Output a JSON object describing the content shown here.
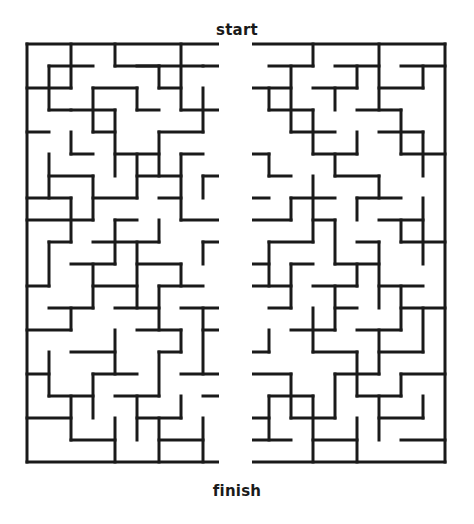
{
  "page": {
    "background_color": "#ffffff",
    "width": 474,
    "height": 524
  },
  "maze": {
    "start_label": "start",
    "finish_label": "finish",
    "wall_color": "#1a1a1a",
    "wall_thickness": 3,
    "cell_size": 22,
    "origin_x": 27,
    "origin_y": 44,
    "cols": 19,
    "rows": 19,
    "start_opening": {
      "col": 9,
      "side": "top"
    },
    "finish_opening": {
      "col": 9,
      "side": "bottom"
    },
    "spine_gap": {
      "x": 219,
      "width": 33
    },
    "h_walls": [
      [
        0,
        0,
        9
      ],
      [
        0,
        10,
        19
      ],
      [
        1,
        1,
        3
      ],
      [
        1,
        4,
        6
      ],
      [
        1,
        5,
        8
      ],
      [
        1,
        8,
        10
      ],
      [
        1,
        11,
        13
      ],
      [
        1,
        14,
        16
      ],
      [
        1,
        17,
        19
      ],
      [
        2,
        0,
        2
      ],
      [
        2,
        3,
        5
      ],
      [
        2,
        6,
        7
      ],
      [
        2,
        10,
        12
      ],
      [
        2,
        13,
        15
      ],
      [
        2,
        16,
        18
      ],
      [
        3,
        1,
        2
      ],
      [
        3,
        2,
        4
      ],
      [
        3,
        5,
        6
      ],
      [
        3,
        7,
        9
      ],
      [
        3,
        11,
        13
      ],
      [
        3,
        15,
        17
      ],
      [
        4,
        0,
        1
      ],
      [
        4,
        3,
        4
      ],
      [
        4,
        6,
        8
      ],
      [
        4,
        9,
        10
      ],
      [
        4,
        12,
        14
      ],
      [
        4,
        16,
        18
      ],
      [
        5,
        2,
        3
      ],
      [
        5,
        4,
        6
      ],
      [
        5,
        7,
        8
      ],
      [
        5,
        10,
        11
      ],
      [
        5,
        13,
        15
      ],
      [
        5,
        17,
        19
      ],
      [
        6,
        1,
        3
      ],
      [
        6,
        5,
        7
      ],
      [
        6,
        8,
        9
      ],
      [
        6,
        11,
        12
      ],
      [
        6,
        14,
        16
      ],
      [
        7,
        0,
        2
      ],
      [
        7,
        3,
        5
      ],
      [
        7,
        6,
        7
      ],
      [
        7,
        9,
        11
      ],
      [
        7,
        12,
        14
      ],
      [
        7,
        15,
        17
      ],
      [
        8,
        0,
        3
      ],
      [
        8,
        4,
        5
      ],
      [
        8,
        7,
        9
      ],
      [
        8,
        10,
        12
      ],
      [
        8,
        13,
        14
      ],
      [
        8,
        16,
        18
      ],
      [
        9,
        1,
        2
      ],
      [
        9,
        3,
        6
      ],
      [
        9,
        8,
        10
      ],
      [
        9,
        11,
        13
      ],
      [
        9,
        15,
        16
      ],
      [
        9,
        17,
        19
      ],
      [
        10,
        2,
        4
      ],
      [
        10,
        5,
        7
      ],
      [
        10,
        9,
        11
      ],
      [
        10,
        12,
        13
      ],
      [
        10,
        14,
        16
      ],
      [
        11,
        0,
        1
      ],
      [
        11,
        3,
        5
      ],
      [
        11,
        6,
        8
      ],
      [
        11,
        10,
        12
      ],
      [
        11,
        13,
        15
      ],
      [
        11,
        16,
        18
      ],
      [
        12,
        1,
        3
      ],
      [
        12,
        4,
        6
      ],
      [
        12,
        7,
        9
      ],
      [
        12,
        11,
        12
      ],
      [
        12,
        14,
        15
      ],
      [
        12,
        17,
        19
      ],
      [
        13,
        0,
        2
      ],
      [
        13,
        5,
        7
      ],
      [
        13,
        8,
        10
      ],
      [
        13,
        12,
        14
      ],
      [
        13,
        15,
        17
      ],
      [
        14,
        2,
        4
      ],
      [
        14,
        6,
        7
      ],
      [
        14,
        9,
        11
      ],
      [
        14,
        13,
        15
      ],
      [
        14,
        16,
        18
      ],
      [
        15,
        0,
        1
      ],
      [
        15,
        3,
        5
      ],
      [
        15,
        7,
        9
      ],
      [
        15,
        10,
        12
      ],
      [
        15,
        14,
        16
      ],
      [
        15,
        17,
        19
      ],
      [
        16,
        1,
        3
      ],
      [
        16,
        4,
        6
      ],
      [
        16,
        8,
        10
      ],
      [
        16,
        11,
        13
      ],
      [
        16,
        15,
        17
      ],
      [
        17,
        0,
        2
      ],
      [
        17,
        5,
        7
      ],
      [
        17,
        9,
        11
      ],
      [
        17,
        12,
        14
      ],
      [
        17,
        16,
        18
      ],
      [
        18,
        2,
        4
      ],
      [
        18,
        6,
        8
      ],
      [
        18,
        10,
        12
      ],
      [
        18,
        13,
        15
      ],
      [
        18,
        17,
        19
      ],
      [
        19,
        0,
        9
      ],
      [
        19,
        10,
        19
      ]
    ],
    "v_walls": [
      [
        0,
        0,
        19
      ],
      [
        1,
        1,
        3
      ],
      [
        1,
        5,
        7
      ],
      [
        1,
        9,
        11
      ],
      [
        1,
        14,
        16
      ],
      [
        2,
        0,
        2
      ],
      [
        2,
        4,
        5
      ],
      [
        2,
        7,
        9
      ],
      [
        2,
        12,
        13
      ],
      [
        2,
        16,
        18
      ],
      [
        3,
        2,
        4
      ],
      [
        3,
        6,
        8
      ],
      [
        3,
        10,
        12
      ],
      [
        3,
        15,
        17
      ],
      [
        4,
        0,
        1
      ],
      [
        4,
        3,
        6
      ],
      [
        4,
        8,
        10
      ],
      [
        4,
        13,
        15
      ],
      [
        4,
        17,
        19
      ],
      [
        5,
        2,
        3
      ],
      [
        5,
        5,
        7
      ],
      [
        5,
        9,
        12
      ],
      [
        5,
        16,
        18
      ],
      [
        6,
        1,
        2
      ],
      [
        6,
        4,
        6
      ],
      [
        6,
        8,
        9
      ],
      [
        6,
        11,
        13
      ],
      [
        6,
        14,
        16
      ],
      [
        6,
        17,
        19
      ],
      [
        7,
        0,
        3
      ],
      [
        7,
        5,
        8
      ],
      [
        7,
        10,
        11
      ],
      [
        7,
        13,
        14
      ],
      [
        7,
        16,
        17
      ],
      [
        8,
        2,
        4
      ],
      [
        8,
        6,
        7
      ],
      [
        8,
        9,
        10
      ],
      [
        8,
        12,
        15
      ],
      [
        8,
        17,
        19
      ],
      [
        9,
        1,
        2
      ],
      [
        9,
        4,
        5
      ],
      [
        9,
        8,
        9
      ],
      [
        9,
        11,
        13
      ],
      [
        9,
        15,
        18
      ],
      [
        10,
        0,
        2
      ],
      [
        10,
        3,
        4
      ],
      [
        10,
        6,
        8
      ],
      [
        10,
        10,
        12
      ],
      [
        10,
        14,
        16
      ],
      [
        10,
        17,
        19
      ],
      [
        11,
        2,
        3
      ],
      [
        11,
        5,
        6
      ],
      [
        11,
        9,
        11
      ],
      [
        11,
        13,
        14
      ],
      [
        11,
        16,
        18
      ],
      [
        12,
        1,
        4
      ],
      [
        12,
        7,
        8
      ],
      [
        12,
        10,
        12
      ],
      [
        12,
        15,
        17
      ],
      [
        13,
        0,
        1
      ],
      [
        13,
        3,
        5
      ],
      [
        13,
        6,
        9
      ],
      [
        13,
        12,
        14
      ],
      [
        13,
        16,
        19
      ],
      [
        14,
        2,
        3
      ],
      [
        14,
        5,
        6
      ],
      [
        14,
        8,
        10
      ],
      [
        14,
        11,
        13
      ],
      [
        14,
        15,
        17
      ],
      [
        15,
        1,
        2
      ],
      [
        15,
        4,
        5
      ],
      [
        15,
        7,
        8
      ],
      [
        15,
        10,
        11
      ],
      [
        15,
        14,
        16
      ],
      [
        15,
        17,
        19
      ],
      [
        16,
        0,
        3
      ],
      [
        16,
        6,
        7
      ],
      [
        16,
        9,
        12
      ],
      [
        16,
        13,
        15
      ],
      [
        16,
        16,
        18
      ],
      [
        17,
        3,
        5
      ],
      [
        17,
        8,
        9
      ],
      [
        17,
        11,
        13
      ],
      [
        17,
        15,
        16
      ],
      [
        18,
        1,
        2
      ],
      [
        18,
        4,
        6
      ],
      [
        18,
        7,
        10
      ],
      [
        18,
        12,
        14
      ],
      [
        18,
        16,
        17
      ],
      [
        19,
        0,
        19
      ]
    ]
  }
}
